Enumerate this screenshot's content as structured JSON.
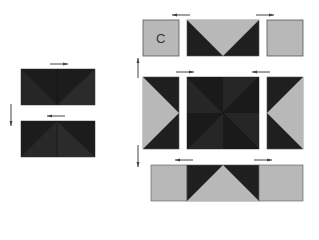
{
  "diagram": {
    "type": "quilt-block-assembly",
    "colors": {
      "dark": "#1f1f1f",
      "dark_alt": "#2a2a2a",
      "light": "#b8b8b8",
      "outline": "#555555",
      "arrow": "#444444"
    },
    "left_unit": {
      "top_strip": {
        "pieces": [
          "dark triangle pair",
          "dark triangle pair"
        ],
        "press_arrow": "right"
      },
      "bottom_strip": {
        "pieces": [
          "dark triangle pair",
          "dark triangle pair"
        ],
        "press_arrow": "left"
      },
      "join_arrow": "down"
    },
    "right_unit": {
      "row1": {
        "pieces": [
          {
            "label": "C",
            "fill": "light square"
          },
          {
            "fill": "flying geese: light goose pointing down, dark corners"
          },
          {
            "fill": "light square"
          }
        ],
        "press_arrows": [
          "left",
          "right"
        ]
      },
      "row2": {
        "pieces": [
          {
            "fill": "flying geese: light goose pointing right, dark corners"
          },
          {
            "fill": "dark pinwheel / hourglass center"
          },
          {
            "fill": "flying geese: light goose pointing left, dark corners"
          }
        ],
        "press_arrows": [
          "right",
          "left"
        ]
      },
      "row3": {
        "pieces": [
          {
            "fill": "light rectangle"
          },
          {
            "fill": "flying geese: light goose pointing up, dark corners"
          },
          {
            "fill": "light rectangle"
          }
        ],
        "press_arrows": [
          "left",
          "right"
        ]
      },
      "row_arrows": [
        "up",
        "down"
      ]
    },
    "labels": {
      "piece_c": "C"
    }
  }
}
